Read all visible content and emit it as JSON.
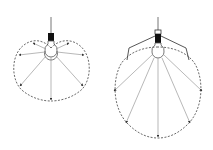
{
  "diagram": {
    "title": "",
    "colors": {
      "line": "#888888",
      "dashed": "#444444",
      "socket": "#111111",
      "background": "#ffffff"
    },
    "figures": [
      {
        "id": "bare-bulb",
        "label": "",
        "has_shade": false,
        "rays": 7
      },
      {
        "id": "shaded-bulb",
        "label": "",
        "has_shade": true,
        "rays": 5
      }
    ]
  }
}
